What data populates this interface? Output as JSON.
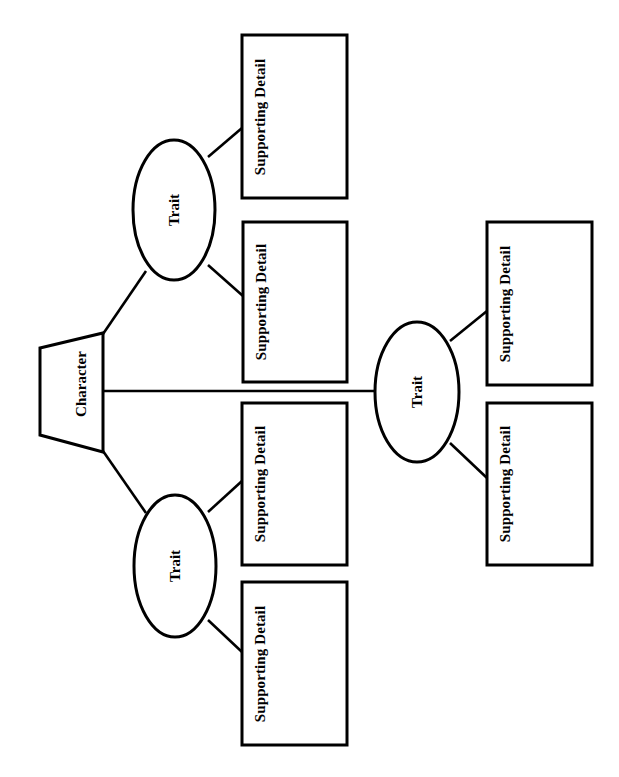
{
  "diagram": {
    "type": "graphic-organizer",
    "orientation": "landscape-rotated",
    "stroke_color": "#000000",
    "background_color": "#ffffff",
    "root": {
      "label": "Character",
      "shape": "trapezoid"
    },
    "traits": [
      {
        "id": "trait-top",
        "label": "Trait",
        "shape": "ellipse",
        "details": [
          {
            "id": "detail-1",
            "label": "Supporting Detail",
            "shape": "rectangle"
          },
          {
            "id": "detail-2",
            "label": "Supporting Detail",
            "shape": "rectangle"
          }
        ]
      },
      {
        "id": "trait-right",
        "label": "Trait",
        "shape": "ellipse",
        "details": [
          {
            "id": "detail-3",
            "label": "Supporting Detail",
            "shape": "rectangle"
          },
          {
            "id": "detail-4",
            "label": "Supporting Detail",
            "shape": "rectangle"
          }
        ]
      },
      {
        "id": "trait-bottom",
        "label": "Trait",
        "shape": "ellipse",
        "details": [
          {
            "id": "detail-5",
            "label": "Supporting Detail",
            "shape": "rectangle"
          },
          {
            "id": "detail-6",
            "label": "Supporting Detail",
            "shape": "rectangle"
          }
        ]
      }
    ]
  }
}
